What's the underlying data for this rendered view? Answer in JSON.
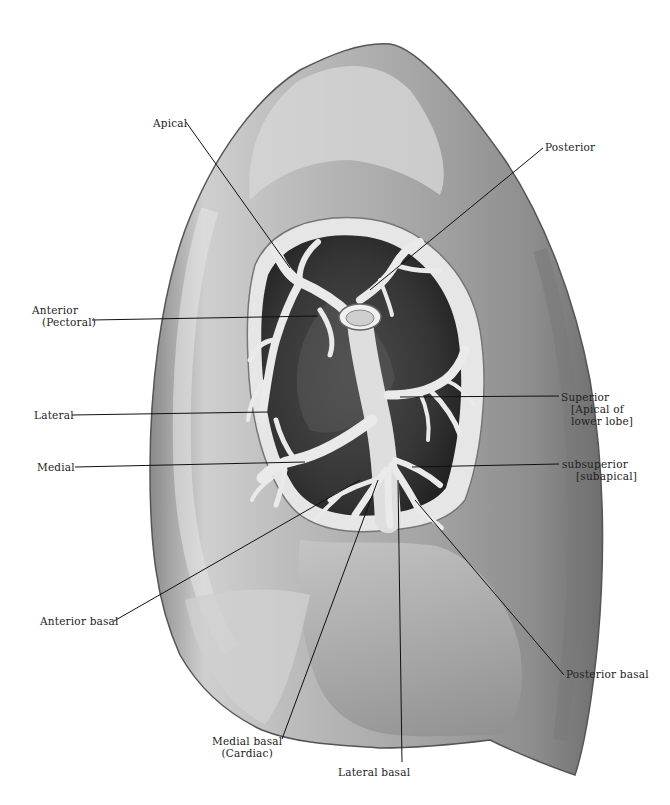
{
  "figure": {
    "colors": {
      "background": "#ffffff",
      "lung_light": "#d9d9d9",
      "lung_mid": "#9a9a9a",
      "lung_dark": "#4a4a4a",
      "bronchus": "#e8e8e8",
      "cavity": "#3a3a3a",
      "label": "#222222",
      "leader": "#111111"
    }
  },
  "labels": [
    {
      "id": "apical",
      "text": "Apical",
      "x": 153,
      "y": 124,
      "anchor": "left",
      "target": [
        290,
        268
      ]
    },
    {
      "id": "posterior",
      "text": "Posterior",
      "x": 545,
      "y": 141,
      "anchor": "left",
      "target": [
        370,
        290
      ]
    },
    {
      "id": "anterior-pectoral",
      "lines": [
        "Anterior",
        "(Pectoral)"
      ],
      "x": 32,
      "y": 304,
      "anchor": "left",
      "target": [
        318,
        318
      ]
    },
    {
      "id": "lateral",
      "text": "Lateral",
      "x": 34,
      "y": 409,
      "anchor": "left",
      "target": [
        293,
        448
      ]
    },
    {
      "id": "medial",
      "text": "Medial",
      "x": 37,
      "y": 461,
      "anchor": "left",
      "target": [
        305,
        462
      ]
    },
    {
      "id": "superior",
      "lines": [
        "Superior",
        "[Apical of",
        "lower lobe]"
      ],
      "x": 562,
      "y": 391,
      "anchor": "left",
      "target": [
        400,
        397
      ]
    },
    {
      "id": "subsuperior",
      "lines": [
        "subsuperior",
        "[subapical]"
      ],
      "x": 562,
      "y": 458,
      "anchor": "left",
      "target": [
        412,
        467
      ]
    },
    {
      "id": "anterior-basal",
      "text": "Anterior basal",
      "x": 40,
      "y": 615,
      "anchor": "left",
      "target": [
        360,
        480
      ]
    },
    {
      "id": "posterior-basal",
      "text": "Posterior basal",
      "x": 566,
      "y": 668,
      "anchor": "left",
      "target": [
        415,
        500
      ]
    },
    {
      "id": "medial-basal",
      "lines": [
        "Medial basal",
        "(Cardiac)"
      ],
      "x": 212,
      "y": 735,
      "anchor": "left",
      "target": [
        378,
        480
      ]
    },
    {
      "id": "lateral-basal",
      "text": "Lateral basal",
      "x": 338,
      "y": 766,
      "anchor": "left",
      "target": [
        398,
        480
      ]
    }
  ]
}
